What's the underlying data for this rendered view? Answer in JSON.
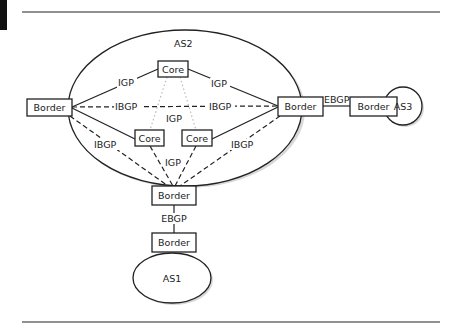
{
  "diagram": {
    "type": "network-topology",
    "autonomous_systems": [
      {
        "id": "as1",
        "label": "AS1"
      },
      {
        "id": "as2",
        "label": "AS2"
      },
      {
        "id": "as3",
        "label": "AS3"
      }
    ],
    "nodes": {
      "as2_border_left": {
        "label": "Border"
      },
      "as2_core_top": {
        "label": "Core"
      },
      "as2_core_mid_left": {
        "label": "Core"
      },
      "as2_core_mid_right": {
        "label": "Core"
      },
      "as2_border_right": {
        "label": "Border"
      },
      "as2_border_bottom": {
        "label": "Border"
      },
      "as3_border": {
        "label": "Border"
      },
      "as1_border": {
        "label": "Border"
      }
    },
    "edge_labels": {
      "igp_left_top": "IGP",
      "igp_top_right": "IGP",
      "ibgp_left_right_1": "IBGP",
      "ibgp_left_right_2": "IBGP",
      "igp_center": "IGP",
      "ibgp_left_bottom": "IBGP",
      "ibgp_right_bottom": "IBGP",
      "igp_cores_bottom": "IGP",
      "ebgp_as2_as3": "EBGP",
      "ebgp_as2_as1": "EBGP"
    },
    "edges": [
      {
        "from": "as2_border_left",
        "to": "as2_core_top",
        "style": "solid",
        "label": "IGP"
      },
      {
        "from": "as2_core_top",
        "to": "as2_border_right",
        "style": "solid",
        "label": "IGP"
      },
      {
        "from": "as2_border_left",
        "to": "as2_core_mid_left",
        "style": "solid"
      },
      {
        "from": "as2_core_mid_right",
        "to": "as2_border_right",
        "style": "solid"
      },
      {
        "from": "as2_border_left",
        "to": "as2_border_right",
        "style": "dashed",
        "label": "IBGP"
      },
      {
        "from": "as2_border_left",
        "to": "as2_border_bottom",
        "style": "dashed",
        "label": "IBGP"
      },
      {
        "from": "as2_border_right",
        "to": "as2_border_bottom",
        "style": "dashed",
        "label": "IBGP"
      },
      {
        "from": "as2_core_mid_left",
        "to": "as2_border_bottom",
        "style": "dashed",
        "label": "IGP"
      },
      {
        "from": "as2_core_mid_right",
        "to": "as2_border_bottom",
        "style": "dashed",
        "label": "IGP"
      },
      {
        "from": "as2_core_top",
        "to": "as2_core_mid_left",
        "style": "dotted",
        "label": "IGP"
      },
      {
        "from": "as2_core_top",
        "to": "as2_core_mid_right",
        "style": "dotted"
      },
      {
        "from": "as2_border_right",
        "to": "as3_border",
        "style": "solid",
        "label": "EBGP"
      },
      {
        "from": "as2_border_bottom",
        "to": "as1_border",
        "style": "solid",
        "label": "EBGP"
      }
    ]
  }
}
